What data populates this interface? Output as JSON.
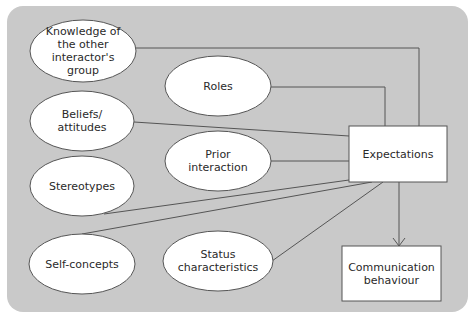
{
  "diagram": {
    "nodes": [
      {
        "id": "knowledge",
        "shape": "ellipse",
        "label": "Knowledge of the other interactor's group",
        "cx": 83,
        "cy": 51,
        "rx": 53,
        "ry": 31
      },
      {
        "id": "roles",
        "shape": "ellipse",
        "label": "Roles",
        "cx": 218,
        "cy": 86,
        "rx": 53,
        "ry": 30
      },
      {
        "id": "beliefs",
        "shape": "ellipse",
        "label": "Beliefs/ attitudes",
        "cx": 82,
        "cy": 121,
        "rx": 52,
        "ry": 30
      },
      {
        "id": "prior",
        "shape": "ellipse",
        "label": "Prior interaction",
        "cx": 218,
        "cy": 161,
        "rx": 53,
        "ry": 30
      },
      {
        "id": "stereotypes",
        "shape": "ellipse",
        "label": "Stereotypes",
        "cx": 82,
        "cy": 186,
        "rx": 52,
        "ry": 30
      },
      {
        "id": "self",
        "shape": "ellipse",
        "label": "Self-concepts",
        "cx": 82,
        "cy": 264,
        "rx": 53,
        "ry": 30
      },
      {
        "id": "status",
        "shape": "ellipse",
        "label": "Status characteristics",
        "cx": 218,
        "cy": 261,
        "rx": 55,
        "ry": 30
      },
      {
        "id": "expectations",
        "shape": "rect",
        "label": "Expectations",
        "x": 349,
        "y": 126,
        "w": 98,
        "h": 56
      },
      {
        "id": "communication",
        "shape": "rect",
        "label": "Communication behaviour",
        "x": 342,
        "y": 246,
        "w": 99,
        "h": 55
      }
    ],
    "edges": [
      {
        "from": "knowledge",
        "to": "expectations",
        "points": [
          [
            136,
            48
          ],
          [
            419,
            48
          ],
          [
            419,
            126
          ]
        ]
      },
      {
        "from": "roles",
        "to": "expectations",
        "points": [
          [
            271,
            87
          ],
          [
            385,
            87
          ],
          [
            385,
            126
          ]
        ]
      },
      {
        "from": "beliefs",
        "to": "expectations",
        "points": [
          [
            134,
            122
          ],
          [
            349,
            136
          ]
        ]
      },
      {
        "from": "prior",
        "to": "expectations",
        "points": [
          [
            271,
            161
          ],
          [
            349,
            161
          ]
        ]
      },
      {
        "from": "stereotypes",
        "to": "expectations",
        "points": [
          [
            104,
            214
          ],
          [
            349,
            180
          ]
        ]
      },
      {
        "from": "self",
        "to": "expectations",
        "points": [
          [
            82,
            234
          ],
          [
            372,
            182
          ]
        ]
      },
      {
        "from": "status",
        "to": "expectations",
        "points": [
          [
            272,
            261
          ],
          [
            383,
            182
          ]
        ]
      },
      {
        "from": "expectations",
        "to": "communication",
        "points": [
          [
            399,
            182
          ],
          [
            399,
            246
          ]
        ],
        "arrow": true
      }
    ],
    "colors": {
      "panel": "#c9c9c9",
      "node_fill": "#ffffff",
      "stroke": "#555555",
      "text": "#2a2a2a"
    }
  }
}
